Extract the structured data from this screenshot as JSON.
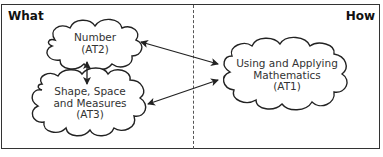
{
  "headings": {
    "left": "What",
    "right": "How"
  },
  "nodes": {
    "number": {
      "line1": "Number",
      "line2": "(AT2)"
    },
    "shape": {
      "line1": "Shape, Space",
      "line2": "and Measures",
      "line3": "(AT3)"
    },
    "using": {
      "line1": "Using and Applying",
      "line2": "Mathematics",
      "line3": "(AT1)"
    }
  },
  "edges": [
    {
      "from": "number",
      "to": "shape",
      "type": "bidirectional"
    },
    {
      "from": "number",
      "to": "using",
      "type": "bidirectional"
    },
    {
      "from": "shape",
      "to": "using",
      "type": "bidirectional"
    }
  ]
}
